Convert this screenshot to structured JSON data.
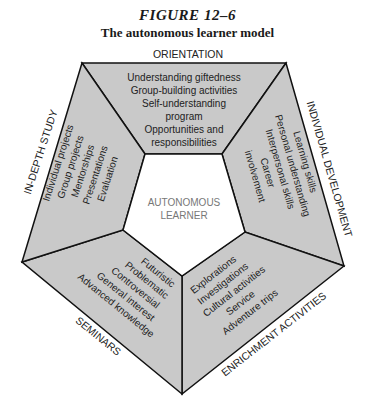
{
  "figure": {
    "number": "FIGURE 12–6",
    "title": "The autonomous learner model"
  },
  "center": {
    "line1": "AUTONOMOUS",
    "line2": "LEARNER"
  },
  "segments": {
    "orientation": {
      "title": "ORIENTATION",
      "items": [
        "Understanding giftedness",
        "Group-building activities",
        "Self-understanding",
        "program",
        "Opportunities and",
        "responsibilities"
      ]
    },
    "individual_development": {
      "title": "INDIVIDUAL DEVELOPMENT",
      "items": [
        "Learning skills",
        "Personal understanding",
        "Interpersonal skills",
        "Career",
        "involvement"
      ]
    },
    "enrichment_activities": {
      "title": "ENRICHMENT ACTIVITIES",
      "items": [
        "Explorations",
        "Investigations",
        "Cultural activities",
        "Service",
        "Adventure trips"
      ]
    },
    "seminars": {
      "title": "SEMINARS",
      "items": [
        "Futuristic",
        "Problematic",
        "Controversial",
        "General interest",
        "Advanced knowledge"
      ]
    },
    "in_depth_study": {
      "title": "IN-DEPTH STUDY",
      "items": [
        "Individual projects",
        "Group projects",
        "Mentorships",
        "Presentations",
        "Evaluation"
      ]
    }
  },
  "colors": {
    "segment_fill": "#c9c9c9",
    "outline": "#111111",
    "center_fill": "#ffffff",
    "center_text": "#777777"
  }
}
